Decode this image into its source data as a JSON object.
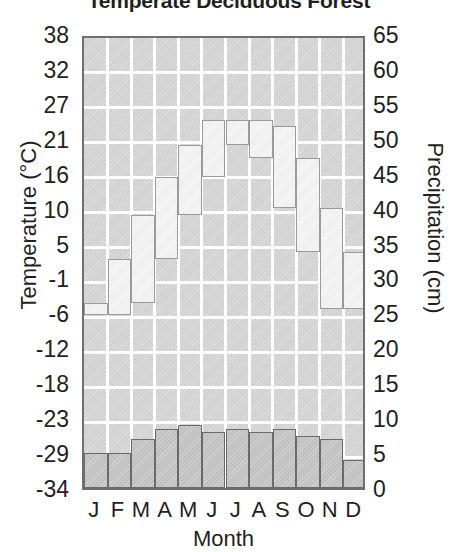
{
  "chart_data": {
    "type": "bar",
    "title": "Temperate Deciduous Forest",
    "xlabel": "Month",
    "categories": [
      "J",
      "F",
      "M",
      "A",
      "M",
      "J",
      "J",
      "A",
      "S",
      "O",
      "N",
      "D"
    ],
    "grid": true,
    "legend": "none",
    "axes": {
      "left": {
        "label": "Temperature (°C)",
        "unit": "°C",
        "ticks": [
          38,
          32,
          27,
          21,
          16,
          10,
          5,
          -1,
          -6,
          -12,
          -18,
          -23,
          -29,
          -34
        ],
        "range": [
          -34,
          38
        ]
      },
      "right": {
        "label": "Precipitation (cm)",
        "unit": "cm",
        "ticks": [
          65,
          60,
          55,
          50,
          45,
          40,
          35,
          30,
          25,
          20,
          15,
          10,
          5,
          0
        ],
        "range": [
          0,
          65
        ]
      }
    },
    "series": [
      {
        "name": "Temperature",
        "axis": "left",
        "style": "stepped-band",
        "unit": "°C",
        "values": [
          -6,
          -4,
          3,
          10,
          16,
          21,
          25,
          24,
          19,
          11,
          4,
          -5
        ]
      },
      {
        "name": "Precipitation",
        "axis": "right",
        "style": "bars",
        "unit": "cm",
        "values": [
          5,
          5,
          7,
          8.5,
          9,
          8,
          8.5,
          8,
          8.5,
          7.5,
          7,
          4
        ]
      }
    ]
  }
}
